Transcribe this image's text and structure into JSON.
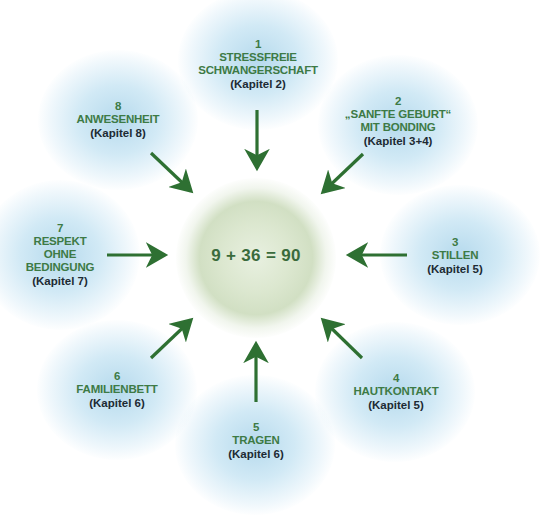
{
  "diagram": {
    "center": {
      "label": "9 + 36 = 90"
    },
    "colors": {
      "title_green": "#3d7a45",
      "chapter_dark": "#1d2a33",
      "arrow_green": "#2e7032",
      "blob_blue": "#b2d8ec",
      "center_glow": "#bed2aa"
    },
    "nodes": [
      {
        "number": "1",
        "title_lines": [
          "STRESSFREIE",
          "SCHWANGERSCHAFT"
        ],
        "chapter": "(Kapitel 2)"
      },
      {
        "number": "2",
        "title_lines": [
          "„SANFTE GEBURT“",
          "MIT BONDING"
        ],
        "chapter": "(Kapitel 3+4)"
      },
      {
        "number": "3",
        "title_lines": [
          "STILLEN"
        ],
        "chapter": "(Kapitel 5)"
      },
      {
        "number": "4",
        "title_lines": [
          "HAUTKONTAKT"
        ],
        "chapter": "(Kapitel 5)"
      },
      {
        "number": "5",
        "title_lines": [
          "TRAGEN"
        ],
        "chapter": "(Kapitel 6)"
      },
      {
        "number": "6",
        "title_lines": [
          "FAMILIENBETT"
        ],
        "chapter": "(Kapitel 6)"
      },
      {
        "number": "7",
        "title_lines": [
          "RESPEKT",
          "OHNE",
          "BEDINGUNG"
        ],
        "chapter": "(Kapitel 7)"
      },
      {
        "number": "8",
        "title_lines": [
          "ANWESENHEIT"
        ],
        "chapter": "(Kapitel 8)"
      }
    ],
    "arrows": [
      {
        "from": "1",
        "to": "center",
        "icon": "arrow-down-icon"
      },
      {
        "from": "2",
        "to": "center",
        "icon": "arrow-down-left-icon"
      },
      {
        "from": "3",
        "to": "center",
        "icon": "arrow-left-icon"
      },
      {
        "from": "4",
        "to": "center",
        "icon": "arrow-up-left-icon"
      },
      {
        "from": "5",
        "to": "center",
        "icon": "arrow-up-icon"
      },
      {
        "from": "6",
        "to": "center",
        "icon": "arrow-up-right-icon"
      },
      {
        "from": "7",
        "to": "center",
        "icon": "arrow-right-icon"
      },
      {
        "from": "8",
        "to": "center",
        "icon": "arrow-down-right-icon"
      }
    ]
  }
}
